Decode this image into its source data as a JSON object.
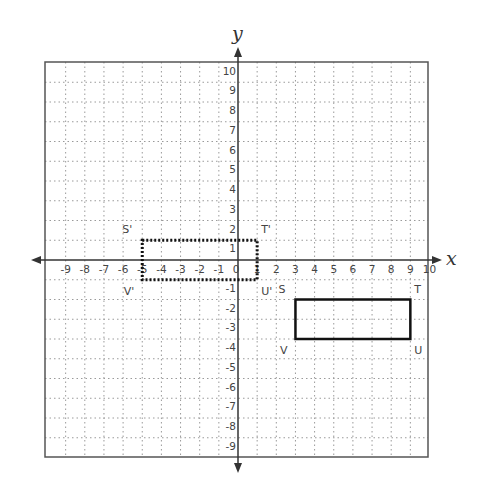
{
  "diagram": {
    "axes": {
      "x_label": "x",
      "y_label": "y",
      "x_range": [
        -10,
        10
      ],
      "y_range": [
        -10,
        10
      ],
      "x_tick_labels": [
        "-9",
        "-8",
        "-7",
        "-6",
        "-5",
        "-4",
        "-3",
        "-2",
        "-1",
        "0",
        "1",
        "2",
        "3",
        "4",
        "5",
        "6",
        "7",
        "8",
        "9",
        "10"
      ],
      "y_tick_labels_positive": [
        "1",
        "2",
        "3",
        "4",
        "5",
        "6",
        "7",
        "8",
        "9",
        "10"
      ],
      "y_tick_labels_negative": [
        "-1",
        "-2",
        "-3",
        "-4",
        "-5",
        "-6",
        "-7",
        "-8",
        "-9"
      ]
    },
    "grid": {
      "style": "dotted",
      "color": "#9a9a9a",
      "frame_color": "#555555"
    },
    "shapes": [
      {
        "name": "original-rectangle",
        "style": "solid",
        "vertices": [
          {
            "label": "S",
            "x": 3,
            "y": -2
          },
          {
            "label": "T",
            "x": 9,
            "y": -2
          },
          {
            "label": "U",
            "x": 9,
            "y": -4
          },
          {
            "label": "V",
            "x": 3,
            "y": -4
          }
        ]
      },
      {
        "name": "image-rectangle",
        "style": "dotted",
        "vertices": [
          {
            "label": "S'",
            "x": -5,
            "y": 1
          },
          {
            "label": "T'",
            "x": 1,
            "y": 1
          },
          {
            "label": "U'",
            "x": 1,
            "y": -1
          },
          {
            "label": "V'",
            "x": -5,
            "y": -1
          }
        ]
      }
    ]
  }
}
